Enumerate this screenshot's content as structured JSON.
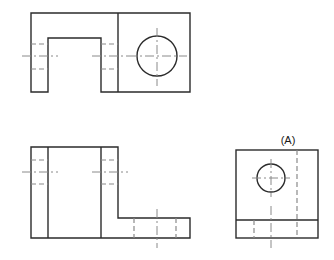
{
  "sheet": {
    "width": 334,
    "height": 260,
    "background_color": "#ffffff",
    "line_color": "#2b2b2b",
    "hidden_line_color": "#8a8a8a",
    "center_line_color": "#8a8a8a",
    "drawing_type": "orthographic-projection",
    "view_count": 3
  },
  "views": {
    "top": {
      "name": "top-view",
      "outline_points": "31,13 190,13 190,92 101,92 101,38 48,38 48,92 31,92",
      "vertical_divider_x": 118,
      "hole": {
        "center_x": 157,
        "center_y": 56,
        "radius": 20
      },
      "hidden_lines": [
        {
          "x1": 31,
          "y1": 44,
          "x2": 48,
          "y2": 44
        },
        {
          "x1": 31,
          "y1": 69,
          "x2": 48,
          "y2": 69
        },
        {
          "x1": 101,
          "y1": 44,
          "x2": 118,
          "y2": 44
        },
        {
          "x1": 101,
          "y1": 69,
          "x2": 118,
          "y2": 69
        }
      ],
      "center_lines": [
        {
          "x1": 22,
          "y1": 56,
          "x2": 58,
          "y2": 56
        },
        {
          "x1": 92,
          "y1": 56,
          "x2": 128,
          "y2": 56
        },
        {
          "x1": 128,
          "y1": 56,
          "x2": 187,
          "y2": 56
        },
        {
          "x1": 157,
          "y1": 28,
          "x2": 157,
          "y2": 86
        }
      ]
    },
    "front": {
      "name": "front-view",
      "outline_points": "31,147 118,147 118,218 190,218 190,238 31,238",
      "vertical_lines": [
        {
          "x": 48,
          "y1": 147,
          "y2": 238
        },
        {
          "x": 101,
          "y1": 147,
          "y2": 238
        }
      ],
      "hidden_lines": [
        {
          "x1": 31,
          "y1": 160,
          "x2": 48,
          "y2": 160
        },
        {
          "x1": 31,
          "y1": 184,
          "x2": 48,
          "y2": 184
        },
        {
          "x1": 101,
          "y1": 160,
          "x2": 118,
          "y2": 160
        },
        {
          "x1": 101,
          "y1": 184,
          "x2": 118,
          "y2": 184
        },
        {
          "x1": 134,
          "y1": 218,
          "x2": 134,
          "y2": 238
        },
        {
          "x1": 176,
          "y1": 218,
          "x2": 176,
          "y2": 238
        }
      ],
      "center_lines": [
        {
          "x1": 22,
          "y1": 172,
          "x2": 58,
          "y2": 172
        },
        {
          "x1": 92,
          "y1": 172,
          "x2": 128,
          "y2": 172
        },
        {
          "x1": 157,
          "y1": 209,
          "x2": 157,
          "y2": 248
        }
      ]
    },
    "side": {
      "name": "side-view",
      "label": "(A)",
      "label_x": 288,
      "label_y": 144,
      "outline": {
        "x": 236,
        "y": 150,
        "width": 82,
        "height": 88
      },
      "horizontal_division_y": 220,
      "hole": {
        "center_x": 271,
        "center_y": 178,
        "radius": 14
      },
      "hidden_lines": [
        {
          "x1": 297,
          "y1": 150,
          "x2": 297,
          "y2": 238
        },
        {
          "x1": 254,
          "y1": 220,
          "x2": 254,
          "y2": 238
        }
      ],
      "center_lines": [
        {
          "x1": 252,
          "y1": 178,
          "x2": 290,
          "y2": 178
        },
        {
          "x1": 271,
          "y1": 159,
          "x2": 271,
          "y2": 197
        },
        {
          "x1": 271,
          "y1": 206,
          "x2": 271,
          "y2": 248
        }
      ]
    }
  }
}
